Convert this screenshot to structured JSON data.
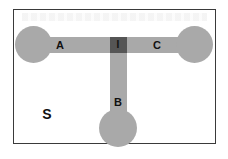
{
  "diagram": {
    "type": "T-junction channel schematic",
    "labels": {
      "left_arm": "A",
      "right_arm": "C",
      "bottom_arm": "B",
      "junction": "I",
      "substrate": "S"
    },
    "colors": {
      "channel": "#a9a9a9",
      "junction": "#555555",
      "border": "#3a3a3a",
      "background": "#ffffff",
      "text": "#111111"
    }
  }
}
